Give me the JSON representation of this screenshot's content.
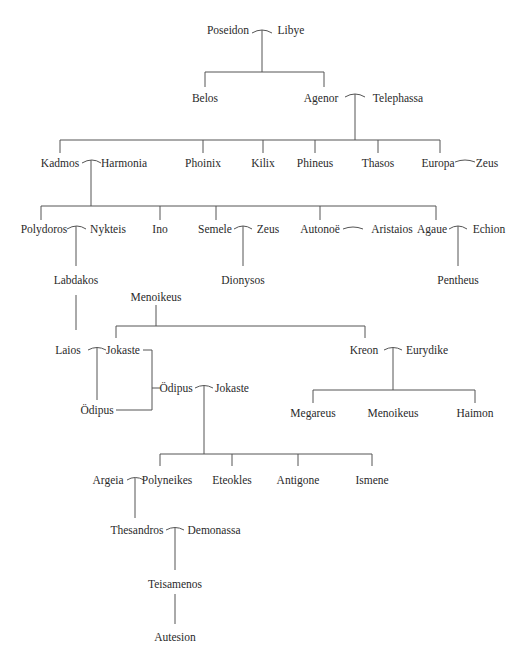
{
  "people": {
    "poseidon": "Poseidon",
    "libye": "Libye",
    "belos": "Belos",
    "agenor": "Agenor",
    "telephassa": "Telephassa",
    "kadmos": "Kadmos",
    "harmonia": "Harmonia",
    "phoinix": "Phoinix",
    "kilix": "Kilix",
    "phineus": "Phineus",
    "thasos": "Thasos",
    "europa": "Europa",
    "zeus1": "Zeus",
    "polydoros": "Polydoros",
    "nykteis": "Nykteis",
    "ino": "Ino",
    "semele": "Semele",
    "zeus2": "Zeus",
    "autonoe": "Autonoë",
    "aristaios": "Aristaios",
    "agaue": "Agaue",
    "echion": "Echion",
    "labdakos": "Labdakos",
    "dionysos": "Dionysos",
    "pentheus": "Pentheus",
    "menoikeus1": "Menoikeus",
    "laios": "Laios",
    "jokaste1": "Jokaste",
    "kreon": "Kreon",
    "eurydike": "Eurydike",
    "oedipus1": "Ödipus",
    "oedipus2": "Ödipus",
    "jokaste2": "Jokaste",
    "megareus": "Megareus",
    "menoikeus2": "Menoikeus",
    "haimon": "Haimon",
    "argeia": "Argeia",
    "polyneikes": "Polyneikes",
    "eteokles": "Eteokles",
    "antigone": "Antigone",
    "ismene": "Ismene",
    "thesandros": "Thesandros",
    "demonassa": "Demonassa",
    "teisamenos": "Teisamenos",
    "autesion": "Autesion"
  },
  "colors": {
    "line": "#555555",
    "text": "#2a2a2a",
    "background": "#ffffff"
  }
}
